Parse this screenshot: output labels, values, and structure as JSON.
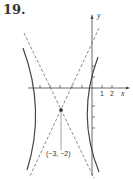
{
  "problem_number": "19.",
  "axes": {
    "x_label": "x",
    "y_label": "y",
    "x_ticks": [
      "1",
      "2"
    ]
  },
  "center": {
    "label": "(−3, −2)",
    "x": -3,
    "y": -2
  },
  "figure": {
    "type": "hyperbola",
    "orientation": "horizontal transverse axis",
    "asymptotes": "dashed"
  }
}
